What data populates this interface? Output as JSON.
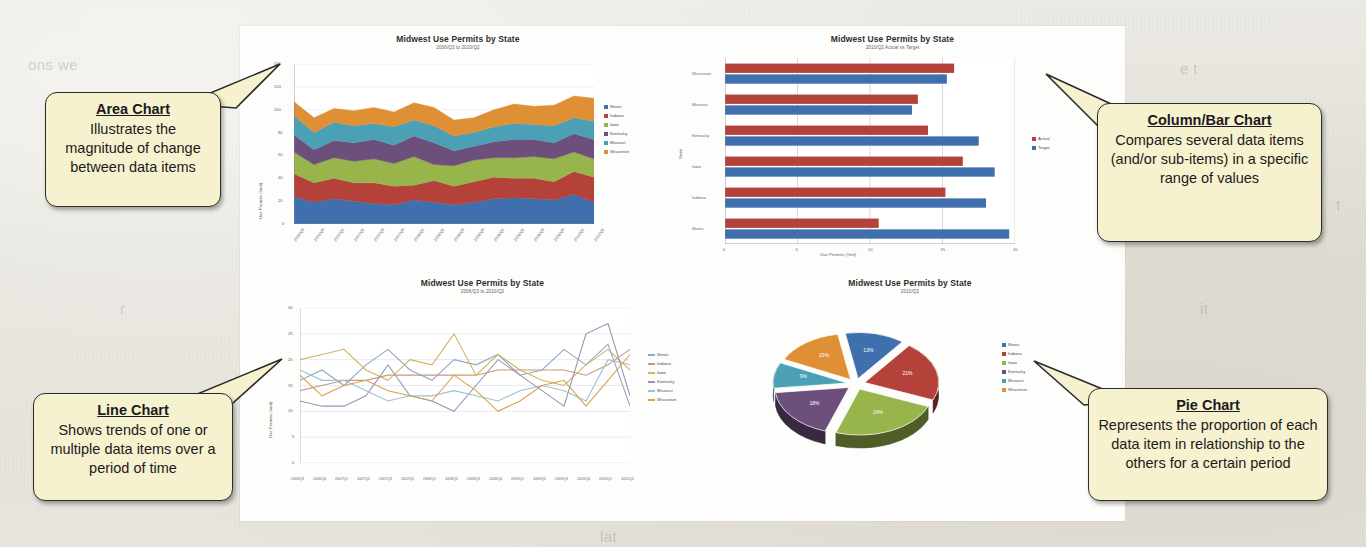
{
  "slide": {
    "background_color": "#e7e4dd",
    "canvas_color": "#fdfdfc",
    "ghost_text": [
      {
        "text": "ons we",
        "x": 28,
        "y": 56
      },
      {
        "text": "to e",
        "x": 470,
        "y": 22
      },
      {
        "text": "l the ve",
        "x": 600,
        "y": 24
      },
      {
        "text": "e t",
        "x": 1180,
        "y": 60
      },
      {
        "text": "in",
        "x": 1300,
        "y": 120
      },
      {
        "text": "t",
        "x": 1336,
        "y": 196
      },
      {
        "text": "it",
        "x": 1200,
        "y": 300
      },
      {
        "text": "lat",
        "x": 600,
        "y": 528
      },
      {
        "text": "r",
        "x": 120,
        "y": 300
      }
    ]
  },
  "palette": {
    "illinois": "#3f6fad",
    "indiana": "#b4413a",
    "iowa": "#97b54a",
    "kentucky": "#6d4f7c",
    "missouri": "#4ba0b5",
    "wisconsin": "#df8f34",
    "actual": "#b4413a",
    "target": "#3f6fad",
    "callout_fill": "#f6f2cf",
    "callout_border": "#2b2b2b"
  },
  "callouts": [
    {
      "id": "area",
      "title": "Area Chart",
      "body": "Illustrates the magnitude of change between data items"
    },
    {
      "id": "column-bar",
      "title": "Column/Bar Chart",
      "body": "Compares several data items (and/or sub-items) in a specific range of values"
    },
    {
      "id": "line",
      "title": "Line Chart",
      "body": "Shows trends of one or multiple data items over a period of time"
    },
    {
      "id": "pie",
      "title": "Pie Chart",
      "body": "Represents the proportion of each data item in relationship to the others for a certain period"
    }
  ],
  "chart_data": [
    {
      "id": "area-chart",
      "type": "area",
      "title": "Midwest Use Permits by State",
      "subtitle": "2006/Q3 to 2010/Q2",
      "xlabel": "",
      "ylabel": "Use Permits (#mil)",
      "ylim": [
        0,
        140
      ],
      "yticks": [
        0,
        20,
        40,
        60,
        80,
        100,
        120,
        140
      ],
      "grid": true,
      "legend_position": "right",
      "categories": [
        "2006/Q3",
        "2006/Q4",
        "2007/Q1",
        "2007/Q2",
        "2007/Q3",
        "2007/Q4",
        "2008/Q1",
        "2008/Q2",
        "2008/Q3",
        "2008/Q4",
        "2009/Q1",
        "2009/Q2",
        "2009/Q3",
        "2009/Q4",
        "2010/Q1",
        "2010/Q2"
      ],
      "series": [
        {
          "name": "Illinois",
          "color": "#3f6fad",
          "values": [
            24,
            19,
            22,
            20,
            18,
            17,
            21,
            19,
            17,
            19,
            22,
            23,
            22,
            21,
            26,
            19
          ]
        },
        {
          "name": "Indiana",
          "color": "#b4413a",
          "values": [
            20,
            17,
            18,
            16,
            18,
            16,
            13,
            19,
            16,
            18,
            19,
            17,
            18,
            16,
            20,
            22
          ]
        },
        {
          "name": "Iowa",
          "color": "#97b54a",
          "values": [
            19,
            16,
            18,
            19,
            21,
            20,
            25,
            14,
            18,
            19,
            17,
            18,
            19,
            20,
            17,
            16
          ]
        },
        {
          "name": "Kentucky",
          "color": "#6d4f7c",
          "values": [
            15,
            13,
            15,
            16,
            17,
            16,
            18,
            19,
            13,
            12,
            14,
            16,
            15,
            14,
            16,
            17
          ]
        },
        {
          "name": "Missouri",
          "color": "#4ba0b5",
          "values": [
            17,
            15,
            16,
            15,
            14,
            16,
            14,
            15,
            13,
            12,
            13,
            14,
            13,
            15,
            14,
            16
          ]
        },
        {
          "name": "Wisconsin",
          "color": "#df8f34",
          "values": [
            12,
            13,
            12,
            13,
            14,
            13,
            15,
            16,
            14,
            13,
            15,
            17,
            16,
            18,
            19,
            20
          ]
        }
      ]
    },
    {
      "id": "bar-chart",
      "type": "bar",
      "orientation": "horizontal",
      "title": "Midwest Use Permits by State",
      "subtitle": "2010/Q2 Actual vs Target",
      "xlabel": "Use Permits (#mil)",
      "ylabel": "State",
      "xlim": [
        0,
        20
      ],
      "xticks": [
        0,
        5,
        10,
        15,
        20
      ],
      "grid": true,
      "legend_position": "right",
      "categories": [
        "Illinois",
        "Indiana",
        "Iowa",
        "Kentucky",
        "Missouri",
        "Wisconsin"
      ],
      "series": [
        {
          "name": "Actual",
          "color": "#b4413a",
          "values": [
            10.6,
            15.2,
            16.4,
            14.0,
            13.3,
            15.8
          ]
        },
        {
          "name": "Target",
          "color": "#3f6fad",
          "values": [
            19.6,
            18.0,
            18.6,
            17.5,
            12.9,
            15.3
          ]
        }
      ]
    },
    {
      "id": "line-chart",
      "type": "line",
      "title": "Midwest Use Permits by State",
      "subtitle": "2006/Q3 to 2010/Q2",
      "xlabel": "",
      "ylabel": "Use Permits (#mil)",
      "ylim": [
        0,
        30
      ],
      "yticks": [
        0,
        5,
        10,
        15,
        20,
        25,
        30
      ],
      "grid": true,
      "legend_position": "right",
      "categories": [
        "2006/Q3",
        "2006/Q4",
        "2007/Q1",
        "2007/Q2",
        "2007/Q3",
        "2007/Q4",
        "2008/Q1",
        "2008/Q2",
        "2008/Q3",
        "2008/Q4",
        "2009/Q1",
        "2009/Q2",
        "2009/Q3",
        "2009/Q4",
        "2010/Q1",
        "2010/Q2"
      ],
      "series": [
        {
          "name": "Illinois",
          "color": "#8fa8c6",
          "values": [
            16,
            18,
            15,
            19,
            22,
            18,
            16,
            20,
            19,
            21,
            17,
            18,
            22,
            19,
            23,
            11
          ]
        },
        {
          "name": "Indiana",
          "color": "#c69a7a",
          "values": [
            14,
            15,
            16,
            16,
            17,
            17,
            17,
            17,
            17,
            18,
            18,
            18,
            18,
            17,
            19,
            22
          ]
        },
        {
          "name": "Iowa",
          "color": "#d2b45e",
          "values": [
            20,
            21,
            22,
            18,
            16,
            20,
            19,
            25,
            17,
            21,
            18,
            16,
            15,
            19,
            22,
            18
          ]
        },
        {
          "name": "Kentucky",
          "color": "#9a93b5",
          "values": [
            12,
            11,
            11,
            13,
            19,
            13,
            12,
            10,
            15,
            20,
            17,
            14,
            11,
            25,
            27,
            13
          ]
        },
        {
          "name": "Missouri",
          "color": "#9cc2cf",
          "values": [
            18,
            16,
            16,
            14,
            12,
            13,
            13,
            14,
            13,
            12,
            14,
            15,
            14,
            12,
            20,
            19
          ]
        },
        {
          "name": "Wisconsin",
          "color": "#d9a24a",
          "values": [
            17,
            13,
            15,
            16,
            14,
            13,
            12,
            17,
            14,
            10,
            12,
            15,
            16,
            11,
            16,
            21
          ]
        }
      ]
    },
    {
      "id": "pie-chart",
      "type": "pie",
      "title": "Midwest Use Permits by State",
      "subtitle": "2010/Q2",
      "exploded": true,
      "three_d": true,
      "legend_position": "right",
      "categories": [
        "Illinois",
        "Indiana",
        "Iowa",
        "Kentucky",
        "Missouri",
        "Wisconsin"
      ],
      "values": [
        13,
        21,
        24,
        18,
        9,
        15
      ],
      "labels": [
        "13%",
        "21%",
        "24%",
        "18%",
        "9%",
        "15%"
      ],
      "colors": [
        "#3f6fad",
        "#b4413a",
        "#97b54a",
        "#6d4f7c",
        "#4ba0b5",
        "#df8f34"
      ]
    }
  ]
}
